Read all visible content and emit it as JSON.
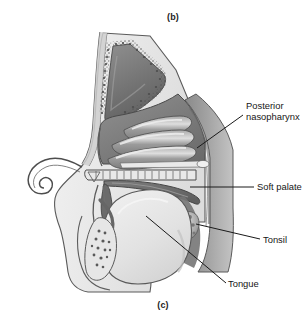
{
  "figure": {
    "caption_top": "(b)",
    "caption_bottom": "(c)",
    "background_color": "#ffffff"
  },
  "labels": [
    {
      "id": "posterior-nasopharynx",
      "line1": "Posterior",
      "line2": "nasopharynx",
      "text": "Posterior nasopharynx",
      "clipped": true
    },
    {
      "id": "soft-palate",
      "text": "Soft palate",
      "clipped": true
    },
    {
      "id": "tonsil",
      "text": "Tonsil",
      "clipped": false
    },
    {
      "id": "tongue",
      "text": "Tongue",
      "clipped": false
    }
  ],
  "colors": {
    "outline": "#4a4a4a",
    "leader_line": "#1a1a1a",
    "mucosa_dark": "#6e6e6e",
    "mucosa_mid": "#8d8d8d",
    "turbinate": "#8a8a8a",
    "turbinate_highlight": "#d8d8d8",
    "tongue_fill": "#e3e3e3",
    "tissue_light": "#ececec",
    "bone_stipple": "#555555",
    "pharynx_wall": "#9a9a9a",
    "sinus_dark": "#737373",
    "text": "#161616"
  },
  "structures": [
    "frontal sinus",
    "superior nasal concha",
    "middle nasal concha",
    "inferior nasal concha",
    "hard palate",
    "soft palate",
    "uvula",
    "posterior nasopharyngeal wall",
    "palatine tonsil",
    "tongue",
    "mandible",
    "sublingual gland",
    "external nose"
  ]
}
